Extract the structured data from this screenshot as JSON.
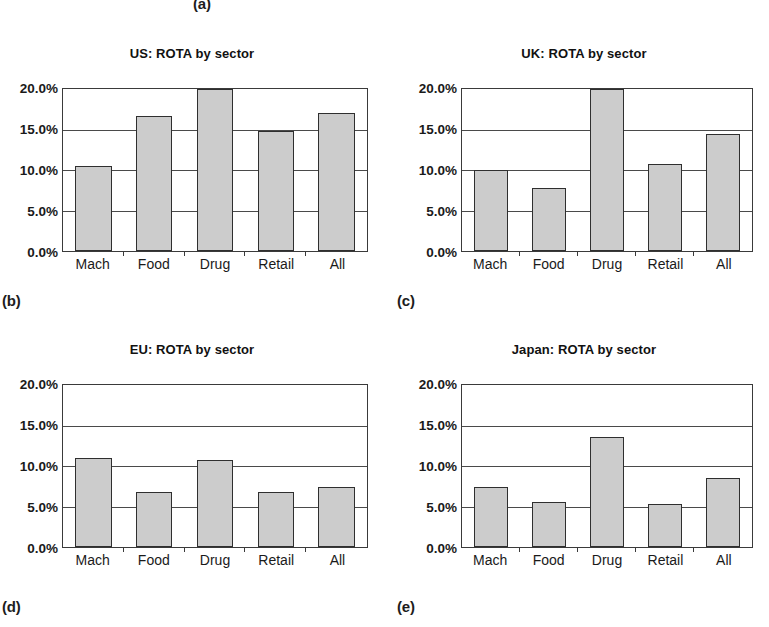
{
  "figure": {
    "labels": {
      "a": "(a)",
      "b": "(b)",
      "c": "(c)",
      "d": "(d)",
      "e": "(e)"
    }
  },
  "axis": {
    "yticks": [
      "20.0%",
      "15.0%",
      "10.0%",
      "5.0%",
      "0.0%"
    ],
    "categories": [
      "Mach",
      "Food",
      "Drug",
      "Retail",
      "All"
    ]
  },
  "colors": {
    "bar_fill": "#cccccc",
    "bar_stroke": "#2f2f2f",
    "grid": "#4a4a4a",
    "text": "#1a1a1a",
    "background": "#ffffff"
  },
  "chart_data": [
    {
      "type": "bar",
      "id": "us",
      "title": "US: ROTA by sector",
      "categories": [
        "Mach",
        "Food",
        "Drug",
        "Retail",
        "All"
      ],
      "values": [
        10.5,
        16.7,
        20.0,
        14.8,
        17.1
      ],
      "xlabel": "",
      "ylabel": "",
      "ylim": [
        0,
        20
      ],
      "yticks": [
        0,
        5,
        10,
        15,
        20
      ],
      "ytick_labels": [
        "0.0%",
        "5.0%",
        "10.0%",
        "15.0%",
        "20.0%"
      ],
      "grid": true,
      "legend": null
    },
    {
      "type": "bar",
      "id": "uk",
      "title": "UK: ROTA by sector",
      "categories": [
        "Mach",
        "Food",
        "Drug",
        "Retail",
        "All"
      ],
      "values": [
        10.0,
        7.8,
        20.0,
        10.8,
        14.4
      ],
      "xlabel": "",
      "ylabel": "",
      "ylim": [
        0,
        20
      ],
      "yticks": [
        0,
        5,
        10,
        15,
        20
      ],
      "ytick_labels": [
        "0.0%",
        "5.0%",
        "10.0%",
        "15.0%",
        "20.0%"
      ],
      "grid": true,
      "legend": null
    },
    {
      "type": "bar",
      "id": "eu",
      "title": "EU: ROTA by sector",
      "categories": [
        "Mach",
        "Food",
        "Drug",
        "Retail",
        "All"
      ],
      "values": [
        11.0,
        6.8,
        10.7,
        6.8,
        7.4
      ],
      "xlabel": "",
      "ylabel": "",
      "ylim": [
        0,
        20
      ],
      "yticks": [
        0,
        5,
        10,
        15,
        20
      ],
      "ytick_labels": [
        "0.0%",
        "5.0%",
        "10.0%",
        "15.0%",
        "20.0%"
      ],
      "grid": true,
      "legend": null
    },
    {
      "type": "bar",
      "id": "japan",
      "title": "Japan: ROTA by sector",
      "categories": [
        "Mach",
        "Food",
        "Drug",
        "Retail",
        "All"
      ],
      "values": [
        7.4,
        5.6,
        13.6,
        5.3,
        8.5
      ],
      "xlabel": "",
      "ylabel": "",
      "ylim": [
        0,
        20
      ],
      "yticks": [
        0,
        5,
        10,
        15,
        20
      ],
      "ytick_labels": [
        "0.0%",
        "5.0%",
        "10.0%",
        "15.0%",
        "20.0%"
      ],
      "grid": true,
      "legend": null
    }
  ]
}
